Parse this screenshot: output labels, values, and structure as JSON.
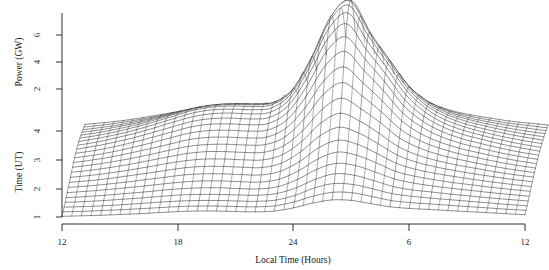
{
  "figure": {
    "name": "power-vs-local-time-waterfall",
    "background": "#ffffff",
    "line_color": "#1a1a1a"
  },
  "chart_data": {
    "type": "line",
    "title": "",
    "subtitle": "",
    "xlabel": "Local Time (Hours)",
    "ylabel": "Power (GW)",
    "y2label": "Time (UT)",
    "grid": false,
    "legend_position": "none",
    "projection": "3d-waterfall-mesh",
    "x": [
      12,
      13,
      14,
      15,
      16,
      17,
      18,
      19,
      20,
      21,
      22,
      23,
      24,
      1,
      2,
      3,
      4,
      5,
      6,
      7,
      8,
      9,
      10,
      11,
      12
    ],
    "xlim": [
      12,
      36
    ],
    "xticks": [
      12,
      18,
      24,
      6,
      12
    ],
    "xtick_values": [
      12,
      18,
      24,
      30,
      36
    ],
    "ylim": [
      0,
      7
    ],
    "yticks": [
      2,
      4,
      6
    ],
    "y2lim": [
      1,
      4.4
    ],
    "y2ticks": [
      1,
      2,
      3,
      4
    ],
    "annotations": [],
    "series": [
      {
        "name": "UT 1.0",
        "ut": 1.0,
        "values": [
          0.1,
          0.12,
          0.14,
          0.17,
          0.2,
          0.24,
          0.28,
          0.3,
          0.3,
          0.28,
          0.27,
          0.3,
          0.42,
          0.6,
          0.72,
          0.7,
          0.58,
          0.46,
          0.4,
          0.36,
          0.32,
          0.28,
          0.24,
          0.2,
          0.16
        ]
      },
      {
        "name": "UT 1.15",
        "ut": 1.15,
        "values": [
          0.12,
          0.14,
          0.17,
          0.2,
          0.24,
          0.28,
          0.32,
          0.34,
          0.34,
          0.32,
          0.31,
          0.35,
          0.5,
          0.72,
          0.86,
          0.84,
          0.7,
          0.55,
          0.47,
          0.42,
          0.37,
          0.32,
          0.27,
          0.22,
          0.18
        ]
      },
      {
        "name": "UT 1.3",
        "ut": 1.3,
        "values": [
          0.15,
          0.17,
          0.2,
          0.24,
          0.29,
          0.34,
          0.38,
          0.4,
          0.4,
          0.38,
          0.37,
          0.42,
          0.6,
          0.88,
          1.04,
          1.0,
          0.84,
          0.66,
          0.56,
          0.49,
          0.43,
          0.37,
          0.31,
          0.25,
          0.2
        ]
      },
      {
        "name": "UT 1.45",
        "ut": 1.45,
        "values": [
          0.18,
          0.21,
          0.25,
          0.3,
          0.35,
          0.41,
          0.46,
          0.48,
          0.48,
          0.46,
          0.45,
          0.52,
          0.74,
          1.06,
          1.26,
          1.2,
          1.0,
          0.78,
          0.65,
          0.57,
          0.49,
          0.42,
          0.35,
          0.29,
          0.23
        ]
      },
      {
        "name": "UT 1.6",
        "ut": 1.6,
        "values": [
          0.21,
          0.25,
          0.3,
          0.36,
          0.42,
          0.49,
          0.55,
          0.58,
          0.58,
          0.55,
          0.54,
          0.63,
          0.9,
          1.28,
          1.5,
          1.42,
          1.18,
          0.92,
          0.76,
          0.65,
          0.56,
          0.48,
          0.4,
          0.33,
          0.26
        ]
      },
      {
        "name": "UT 1.75",
        "ut": 1.75,
        "values": [
          0.25,
          0.3,
          0.36,
          0.43,
          0.5,
          0.58,
          0.65,
          0.69,
          0.69,
          0.66,
          0.65,
          0.76,
          1.08,
          1.52,
          1.78,
          1.66,
          1.38,
          1.06,
          0.87,
          0.74,
          0.63,
          0.54,
          0.45,
          0.37,
          0.3
        ]
      },
      {
        "name": "UT 1.9",
        "ut": 1.9,
        "values": [
          0.3,
          0.35,
          0.42,
          0.5,
          0.59,
          0.68,
          0.77,
          0.81,
          0.81,
          0.78,
          0.77,
          0.91,
          1.28,
          1.8,
          2.08,
          1.92,
          1.58,
          1.21,
          0.98,
          0.83,
          0.71,
          0.6,
          0.5,
          0.41,
          0.33
        ]
      },
      {
        "name": "UT 2.05",
        "ut": 2.05,
        "values": [
          0.34,
          0.4,
          0.48,
          0.58,
          0.68,
          0.79,
          0.89,
          0.94,
          0.94,
          0.91,
          0.9,
          1.07,
          1.5,
          2.1,
          2.42,
          2.2,
          1.8,
          1.37,
          1.1,
          0.92,
          0.78,
          0.66,
          0.55,
          0.45,
          0.36
        ]
      },
      {
        "name": "UT 2.2",
        "ut": 2.2,
        "values": [
          0.38,
          0.45,
          0.54,
          0.65,
          0.77,
          0.9,
          1.01,
          1.07,
          1.07,
          1.04,
          1.04,
          1.24,
          1.74,
          2.44,
          2.8,
          2.5,
          2.04,
          1.54,
          1.22,
          1.01,
          0.85,
          0.72,
          0.59,
          0.48,
          0.39
        ]
      },
      {
        "name": "UT 2.35",
        "ut": 2.35,
        "values": [
          0.42,
          0.5,
          0.6,
          0.72,
          0.86,
          1.0,
          1.13,
          1.2,
          1.2,
          1.17,
          1.18,
          1.42,
          2.0,
          2.8,
          3.22,
          2.82,
          2.3,
          1.72,
          1.35,
          1.1,
          0.92,
          0.77,
          0.63,
          0.51,
          0.41
        ]
      },
      {
        "name": "UT 2.5",
        "ut": 2.5,
        "values": [
          0.46,
          0.55,
          0.66,
          0.79,
          0.94,
          1.1,
          1.25,
          1.32,
          1.33,
          1.3,
          1.32,
          1.6,
          2.28,
          3.2,
          3.66,
          3.16,
          2.56,
          1.9,
          1.47,
          1.19,
          0.98,
          0.82,
          0.67,
          0.54,
          0.43
        ]
      },
      {
        "name": "UT 2.65",
        "ut": 2.65,
        "values": [
          0.49,
          0.59,
          0.71,
          0.86,
          1.02,
          1.19,
          1.36,
          1.44,
          1.45,
          1.42,
          1.45,
          1.78,
          2.56,
          3.6,
          4.1,
          3.5,
          2.82,
          2.07,
          1.58,
          1.26,
          1.03,
          0.86,
          0.7,
          0.56,
          0.45
        ]
      },
      {
        "name": "UT 2.8",
        "ut": 2.8,
        "values": [
          0.52,
          0.62,
          0.75,
          0.91,
          1.09,
          1.28,
          1.46,
          1.55,
          1.56,
          1.53,
          1.57,
          1.95,
          2.84,
          4.0,
          4.54,
          3.82,
          3.06,
          2.22,
          1.68,
          1.32,
          1.07,
          0.89,
          0.72,
          0.58,
          0.46
        ]
      },
      {
        "name": "UT 2.95",
        "ut": 2.95,
        "values": [
          0.54,
          0.65,
          0.79,
          0.96,
          1.15,
          1.35,
          1.54,
          1.64,
          1.65,
          1.62,
          1.67,
          2.1,
          3.1,
          4.38,
          4.94,
          4.1,
          3.26,
          2.34,
          1.75,
          1.36,
          1.1,
          0.91,
          0.74,
          0.59,
          0.47
        ]
      },
      {
        "name": "UT 3.1",
        "ut": 3.1,
        "values": [
          0.55,
          0.67,
          0.82,
          0.99,
          1.19,
          1.4,
          1.6,
          1.7,
          1.72,
          1.69,
          1.75,
          2.22,
          3.32,
          4.7,
          5.28,
          4.32,
          3.4,
          2.42,
          1.79,
          1.38,
          1.11,
          0.92,
          0.74,
          0.6,
          0.47
        ]
      },
      {
        "name": "UT 3.25",
        "ut": 3.25,
        "values": [
          0.55,
          0.67,
          0.83,
          1.0,
          1.21,
          1.43,
          1.63,
          1.74,
          1.76,
          1.73,
          1.8,
          2.3,
          3.48,
          4.94,
          5.54,
          4.48,
          3.48,
          2.46,
          1.8,
          1.38,
          1.11,
          0.91,
          0.74,
          0.59,
          0.47
        ]
      },
      {
        "name": "UT 3.4",
        "ut": 3.4,
        "values": [
          0.54,
          0.66,
          0.81,
          0.99,
          1.2,
          1.42,
          1.63,
          1.74,
          1.76,
          1.74,
          1.81,
          2.34,
          3.56,
          5.08,
          5.68,
          4.54,
          3.5,
          2.46,
          1.78,
          1.36,
          1.09,
          0.89,
          0.72,
          0.58,
          0.46
        ]
      },
      {
        "name": "UT 3.55",
        "ut": 3.55,
        "values": [
          0.52,
          0.63,
          0.78,
          0.96,
          1.16,
          1.38,
          1.59,
          1.7,
          1.73,
          1.71,
          1.79,
          2.32,
          3.56,
          5.1,
          5.7,
          4.5,
          3.44,
          2.4,
          1.73,
          1.32,
          1.05,
          0.86,
          0.7,
          0.56,
          0.44
        ]
      },
      {
        "name": "UT 3.7",
        "ut": 3.7,
        "values": [
          0.48,
          0.59,
          0.73,
          0.9,
          1.09,
          1.3,
          1.5,
          1.61,
          1.64,
          1.63,
          1.71,
          2.24,
          3.46,
          5.0,
          5.58,
          4.36,
          3.32,
          2.3,
          1.65,
          1.25,
          1.0,
          0.82,
          0.66,
          0.53,
          0.42
        ]
      },
      {
        "name": "UT 3.85",
        "ut": 3.85,
        "values": [
          0.44,
          0.54,
          0.67,
          0.82,
          1.0,
          1.2,
          1.38,
          1.49,
          1.52,
          1.51,
          1.59,
          2.1,
          3.28,
          4.78,
          5.32,
          4.12,
          3.12,
          2.15,
          1.54,
          1.16,
          0.93,
          0.76,
          0.61,
          0.49,
          0.39
        ]
      },
      {
        "name": "UT 4.0",
        "ut": 4.0,
        "values": [
          0.39,
          0.48,
          0.59,
          0.73,
          0.89,
          1.07,
          1.24,
          1.34,
          1.37,
          1.36,
          1.44,
          1.92,
          3.02,
          4.44,
          4.92,
          3.8,
          2.86,
          1.96,
          1.4,
          1.06,
          0.84,
          0.69,
          0.56,
          0.45,
          0.35
        ]
      },
      {
        "name": "UT 4.15",
        "ut": 4.15,
        "values": [
          0.34,
          0.42,
          0.52,
          0.64,
          0.78,
          0.94,
          1.09,
          1.18,
          1.21,
          1.2,
          1.28,
          1.71,
          2.7,
          3.99,
          4.4,
          3.4,
          2.55,
          1.74,
          1.24,
          0.94,
          0.75,
          0.61,
          0.49,
          0.4,
          0.31
        ]
      },
      {
        "name": "UT 4.3",
        "ut": 4.3,
        "values": [
          0.29,
          0.36,
          0.44,
          0.55,
          0.67,
          0.8,
          0.93,
          1.01,
          1.04,
          1.03,
          1.1,
          1.48,
          2.34,
          3.46,
          3.82,
          2.95,
          2.21,
          1.5,
          1.07,
          0.81,
          0.65,
          0.53,
          0.42,
          0.34,
          0.27
        ]
      }
    ]
  },
  "axes": {
    "x_axis": {
      "title": "Local Time (Hours)",
      "tick_labels": [
        "12",
        "18",
        "24",
        "6",
        "12"
      ]
    },
    "y_axis_upper": {
      "title": "Power (GW)",
      "tick_labels": [
        "6",
        "4",
        "2"
      ]
    },
    "y_axis_lower": {
      "title": "Time (UT)",
      "tick_labels": [
        "4",
        "3",
        "2",
        "1"
      ]
    }
  }
}
